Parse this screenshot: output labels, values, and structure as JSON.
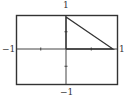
{
  "chart_data": {
    "type": "line",
    "title": "",
    "xlabel": "",
    "ylabel": "",
    "xlim": [
      -1,
      1
    ],
    "ylim": [
      -1,
      1
    ],
    "grid": false,
    "frame": true,
    "tick_labels": {
      "top": "1",
      "bottom": "−1",
      "left": "−1",
      "right": "1"
    },
    "x_ticks": [
      -0.5,
      0.5
    ],
    "y_ticks": [
      -0.5,
      0.5
    ],
    "series": [
      {
        "name": "triangle",
        "x": [
          0,
          0,
          0.93,
          0
        ],
        "y": [
          0,
          0.93,
          0,
          0
        ],
        "color": "#333333"
      }
    ],
    "axis_color": "#444444",
    "frame_color": "#333333"
  }
}
